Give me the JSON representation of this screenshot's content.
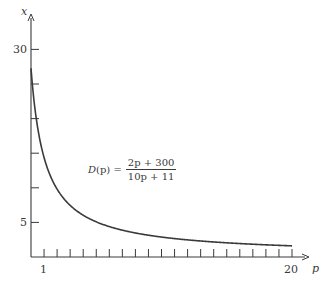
{
  "chart_data": {
    "type": "line",
    "title": "",
    "xlabel": "p",
    "ylabel": "x",
    "xlim": [
      0,
      21
    ],
    "ylim": [
      0,
      32
    ],
    "x_ticks": [
      1,
      2,
      3,
      4,
      5,
      6,
      7,
      8,
      9,
      10,
      11,
      12,
      13,
      14,
      15,
      16,
      17,
      18,
      19,
      20
    ],
    "x_tick_labels": {
      "1": "1",
      "20": "20"
    },
    "y_ticks": [
      5,
      10,
      15,
      20,
      25,
      30
    ],
    "y_tick_labels": {
      "5": "5",
      "30": "30"
    },
    "grid": false,
    "annotation": {
      "lhs": "D(p) =",
      "numerator": "2p + 300",
      "denominator": "10p + 11"
    },
    "series": [
      {
        "name": "D(p) = (2p + 300)/(10p + 11)",
        "x": [
          0,
          0.25,
          0.5,
          0.75,
          1,
          1.5,
          2,
          2.5,
          3,
          4,
          5,
          6,
          7,
          8,
          9,
          10,
          11,
          12,
          13,
          14,
          15,
          16,
          17,
          18,
          19,
          20
        ],
        "values": [
          27.27,
          22.23,
          18.75,
          16.2,
          14.29,
          11.59,
          9.81,
          8.5,
          7.51,
          6.14,
          5.24,
          4.59,
          4.11,
          3.73,
          3.43,
          3.19,
          2.99,
          2.82,
          2.68,
          2.56,
          2.45,
          2.36,
          2.28,
          2.21,
          2.15,
          1.61
        ]
      }
    ]
  },
  "axes": {
    "x_label": "p",
    "y_label": "x",
    "x_tick_1": "1",
    "x_tick_20": "20",
    "y_tick_30": "30",
    "y_tick_5": "5"
  },
  "formula": {
    "lhs_fn": "D",
    "lhs_arg": "(p) =",
    "numerator": "2p + 300",
    "denominator": "10p + 11"
  },
  "colors": {
    "ink": "#3a3a3a",
    "background": "#ffffff"
  }
}
